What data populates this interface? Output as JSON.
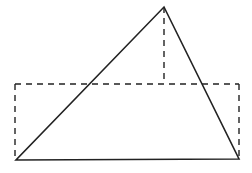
{
  "diagram": {
    "stroke_color": "#222222",
    "triangle": {
      "apex": [
        164,
        7
      ],
      "bottom_left": [
        16,
        160
      ],
      "bottom_right": [
        239,
        159
      ]
    },
    "rectangle": {
      "x": 15,
      "y": 84,
      "width": 224,
      "height": 76,
      "style": "dashed"
    },
    "altitude": {
      "from": [
        164,
        7
      ],
      "to": [
        164,
        84
      ],
      "style": "dashed"
    }
  }
}
